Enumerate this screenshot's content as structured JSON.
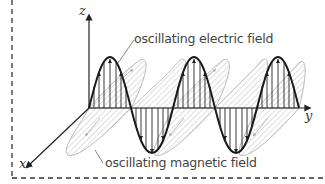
{
  "diagram": {
    "type": "electromagnetic-wave",
    "axes": {
      "x": "x",
      "y": "y",
      "z": "z"
    },
    "labels": {
      "electric": "oscillating electric field",
      "magnetic": "oscillating magnetic field"
    },
    "colors": {
      "electric_wave": "#1a1a1a",
      "magnetic_wave": "#b5b5b5",
      "axes": "#222222",
      "label_text": "#444444",
      "border": "#333333"
    },
    "wave": {
      "cycles": 2.5,
      "wavelength_px": 84
    }
  }
}
